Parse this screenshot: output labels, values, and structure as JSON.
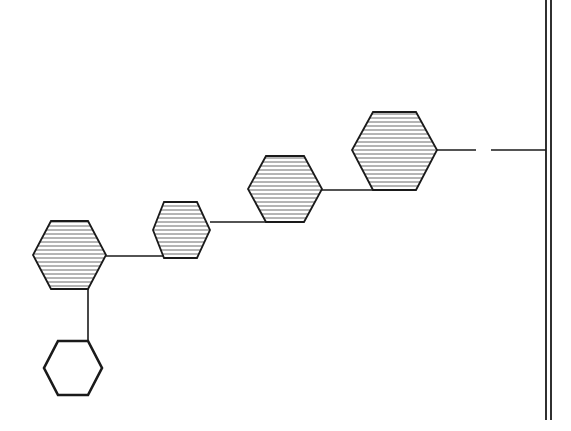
{
  "diagram": {
    "background": "#ffffff",
    "stroke_color": "#1a1a1a",
    "hatch_color": "#6a6a6a",
    "hatch_spacing": 4,
    "wall": {
      "x1": 546,
      "x2": 551,
      "y_top": 0,
      "y_bottom": 420
    },
    "nodes": [
      {
        "id": "hex-1",
        "filled": "hatched",
        "points": [
          [
            51,
            221
          ],
          [
            88,
            221
          ],
          [
            106,
            255
          ],
          [
            88,
            289
          ],
          [
            51,
            289
          ],
          [
            33,
            255
          ]
        ]
      },
      {
        "id": "hex-2",
        "filled": "hatched",
        "points": [
          [
            164,
            202
          ],
          [
            197,
            202
          ],
          [
            210,
            230
          ],
          [
            197,
            258
          ],
          [
            164,
            258
          ],
          [
            153,
            230
          ]
        ]
      },
      {
        "id": "hex-3",
        "filled": "hatched",
        "points": [
          [
            266,
            156
          ],
          [
            304,
            156
          ],
          [
            322,
            189
          ],
          [
            304,
            222
          ],
          [
            266,
            222
          ],
          [
            248,
            189
          ]
        ]
      },
      {
        "id": "hex-4",
        "filled": "hatched",
        "points": [
          [
            373,
            112
          ],
          [
            416,
            112
          ],
          [
            437,
            150
          ],
          [
            416,
            190
          ],
          [
            373,
            190
          ],
          [
            352,
            150
          ]
        ]
      },
      {
        "id": "hex-5",
        "filled": "empty",
        "points": [
          [
            58,
            341
          ],
          [
            88,
            341
          ],
          [
            102,
            368
          ],
          [
            88,
            395
          ],
          [
            58,
            395
          ],
          [
            44,
            368
          ]
        ]
      }
    ],
    "connectors": [
      {
        "id": "hex1-to-hex2",
        "x1": 106,
        "y1": 256,
        "x2": 164,
        "y2": 256
      },
      {
        "id": "hex2-to-hex3",
        "x1": 210,
        "y1": 222,
        "x2": 266,
        "y2": 222
      },
      {
        "id": "hex3-to-hex4",
        "x1": 322,
        "y1": 190,
        "x2": 373,
        "y2": 190
      },
      {
        "id": "hex4-to-gap",
        "x1": 437,
        "y1": 150,
        "x2": 476,
        "y2": 150
      },
      {
        "id": "gap-to-wall",
        "x1": 491,
        "y1": 150,
        "x2": 546,
        "y2": 150
      },
      {
        "id": "hex1-to-hex5",
        "x1": 88,
        "y1": 289,
        "x2": 88,
        "y2": 341
      }
    ]
  }
}
